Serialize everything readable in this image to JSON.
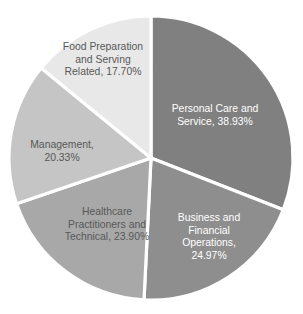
{
  "chart_data": {
    "type": "pie",
    "title": "",
    "subtitle": "",
    "xlabel": "",
    "ylabel": "",
    "legend": "none",
    "grid": false,
    "start_angle_deg": 0,
    "direction": "clockwise",
    "value_suffix": "%",
    "categories": [
      "Personal Care and Service",
      "Business and Financial Operations",
      "Healthcare Practitioners and Technical",
      "Management",
      "Food Preparation and Serving Related"
    ],
    "values": [
      38.93,
      24.97,
      23.9,
      20.33,
      17.7
    ],
    "colors": [
      "#808080",
      "#8e8e8e",
      "#a8a8a8",
      "#c5c5c5",
      "#e8e8e8"
    ],
    "slices": [
      {
        "name": "personal-care-and-service",
        "category": "Personal Care and Service",
        "value": 38.93,
        "value_text": "38.93%",
        "color": "#808080",
        "text_color": "#ffffff",
        "label_lines": [
          "Personal Care and",
          "Service, 38.93%"
        ],
        "label_x": 215,
        "label_y": 112
      },
      {
        "name": "business-and-financial-operations",
        "category": "Business and Financial Operations",
        "value": 24.97,
        "value_text": "24.97%",
        "color": "#8e8e8e",
        "text_color": "#ffffff",
        "label_lines": [
          "Business and",
          "Financial",
          "Operations,",
          "24.97%"
        ],
        "label_x": 209,
        "label_y": 221
      },
      {
        "name": "healthcare-practitioners-and-technical",
        "category": "Healthcare Practitioners and Technical",
        "value": 23.9,
        "value_text": "23.90%",
        "color": "#a8a8a8",
        "text_color": "#585858",
        "label_lines": [
          "Healthcare",
          "Practitioners and",
          "Technical, 23.90%"
        ],
        "label_x": 107,
        "label_y": 215
      },
      {
        "name": "management",
        "category": "Management",
        "value": 20.33,
        "value_text": "20.33%",
        "color": "#c5c5c5",
        "text_color": "#585858",
        "label_lines": [
          "Management,",
          "20.33%"
        ],
        "label_x": 62,
        "label_y": 148
      },
      {
        "name": "food-preparation-and-serving-related",
        "category": "Food Preparation and Serving Related",
        "value": 17.7,
        "value_text": "17.70%",
        "color": "#e8e8e8",
        "text_color": "#585858",
        "label_lines": [
          "Food Preparation",
          "and Serving",
          "Related, 17.70%"
        ],
        "label_x": 103,
        "label_y": 50
      }
    ],
    "geometry": {
      "center_x": 151,
      "center_y": 158,
      "radius": 142
    },
    "background_color": "#ffffff",
    "separator_color": "#ffffff"
  }
}
